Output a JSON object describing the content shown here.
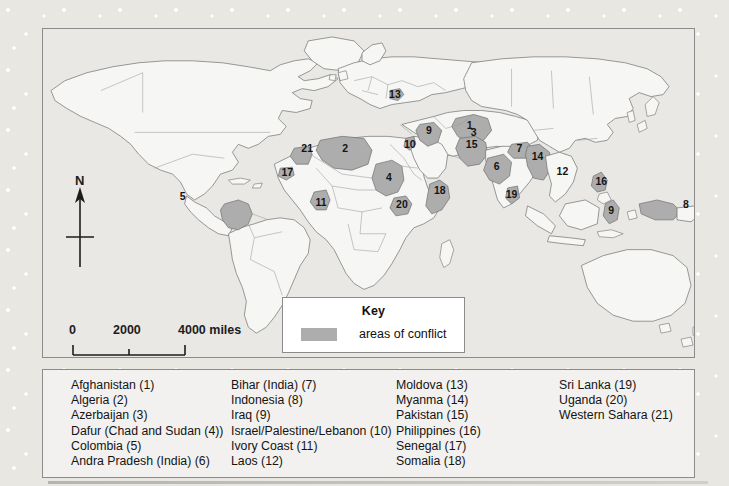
{
  "figure": {
    "type": "world-map"
  },
  "compass": {
    "north_label": "N",
    "icon": "compass-north-arrow-icon"
  },
  "scale_bar": {
    "ticks": [
      "0",
      "2000",
      "4000 miles"
    ],
    "tick_0": "0",
    "tick_2000": "2000",
    "tick_4000": "4000 miles",
    "units": "miles",
    "max_value": 4000
  },
  "key": {
    "title": "Key",
    "swatch_label": "areas of conflict",
    "swatch_color": "#adadad"
  },
  "colors": {
    "conflict_fill": "#adadad",
    "land_fill": "#f5f5f3",
    "ocean_fill": "#e6e5e2",
    "border_stroke": "#8b8b8b",
    "coast_stroke": "#6f6f6f",
    "panel_bg": "#edecea",
    "legend_bg": "#f2f1ef"
  },
  "map_labels": [
    {
      "number": "1",
      "name": "Afghanistan",
      "x": 427,
      "y": 100
    },
    {
      "number": "2",
      "name": "Algeria",
      "x": 303,
      "y": 120
    },
    {
      "number": "3",
      "name": "Azerbaijan",
      "x": 431,
      "y": 109
    },
    {
      "number": "4",
      "name": "Dafur (Chad and Sudan)",
      "x": 347,
      "y": 150
    },
    {
      "number": "5",
      "name": "Colombia",
      "x": 140,
      "y": 169
    },
    {
      "number": "6",
      "name": "Andra Pradesh (India)",
      "x": 456,
      "y": 138
    },
    {
      "number": "7",
      "name": "Bihar (India)",
      "x": 470,
      "y": 122
    },
    {
      "number": "8",
      "name": "Indonesia",
      "x": 647,
      "y": 180
    },
    {
      "number": "9a",
      "name": "Iraq",
      "x": 387,
      "y": 103
    },
    {
      "number": "9b",
      "name": "Indonesia (Sulawesi)",
      "x": 578,
      "y": 183
    },
    {
      "number": "10",
      "name": "Israel/Palestine/Lebanon",
      "x": 370,
      "y": 116
    },
    {
      "number": "11",
      "name": "Ivory Coast",
      "x": 281,
      "y": 177
    },
    {
      "number": "12",
      "name": "Laos",
      "x": 521,
      "y": 144
    },
    {
      "number": "13",
      "name": "Moldova",
      "x": 353,
      "y": 66
    },
    {
      "number": "14",
      "name": "Myanma",
      "x": 494,
      "y": 129
    },
    {
      "number": "15",
      "name": "Pakistan",
      "x": 430,
      "y": 117
    },
    {
      "number": "16",
      "name": "Philippines",
      "x": 561,
      "y": 159
    },
    {
      "number": "17",
      "name": "Senegal",
      "x": 247,
      "y": 146
    },
    {
      "number": "18",
      "name": "Somalia",
      "x": 399,
      "y": 163
    },
    {
      "number": "19",
      "name": "Sri Lanka",
      "x": 470,
      "y": 167
    },
    {
      "number": "20",
      "name": "Uganda",
      "x": 360,
      "y": 177
    },
    {
      "number": "21",
      "name": "Western Sahara",
      "x": 265,
      "y": 124
    }
  ],
  "legend": {
    "columns": [
      {
        "items": [
          "Afghanistan (1)",
          "Algeria (2)",
          "Azerbaijan (3)",
          "Dafur (Chad and Sudan (4))",
          "Colombia (5)",
          "Andra Pradesh (India) (6)"
        ]
      },
      {
        "items": [
          "Bihar (India) (7)",
          "Indonesia (8)",
          "Iraq (9)",
          "Israel/Palestine/Lebanon (10)",
          "Ivory Coast (11)",
          "Laos (12)"
        ]
      },
      {
        "items": [
          "Moldova (13)",
          "Myanma (14)",
          "Pakistan (15)",
          "Philippines (16)",
          "Senegal (17)",
          "Somalia (18)"
        ]
      },
      {
        "items": [
          "Sri Lanka (19)",
          "Uganda (20)",
          "Western Sahara (21)"
        ]
      }
    ]
  }
}
